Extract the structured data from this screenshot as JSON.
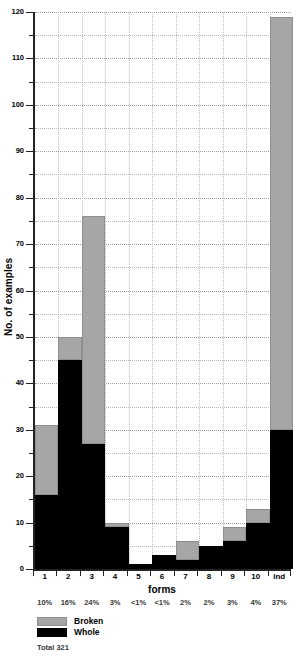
{
  "chart_data": {
    "type": "bar",
    "subtype": "stacked-bar",
    "title": "",
    "xlabel": "forms",
    "ylabel": "No. of examples",
    "categories": [
      "1",
      "2",
      "3",
      "4",
      "5",
      "6",
      "7",
      "8",
      "9",
      "10",
      "ind"
    ],
    "series": [
      {
        "name": "Whole",
        "color": "#000000",
        "values": [
          16,
          45,
          27,
          9,
          1,
          3,
          2,
          5,
          6,
          10,
          30
        ]
      },
      {
        "name": "Broken",
        "color": "#a6a6a6",
        "values": [
          15,
          5,
          49,
          1,
          0,
          0,
          4,
          0,
          3,
          3,
          89
        ]
      }
    ],
    "totals": [
      31,
      50,
      76,
      10,
      1,
      3,
      6,
      5,
      9,
      13,
      119
    ],
    "percent_labels": [
      "10%",
      "16%",
      "24%",
      "3%",
      "<1%",
      "<1%",
      "2%",
      "2%",
      "3%",
      "4%",
      "37%"
    ],
    "ylim": [
      0,
      120
    ],
    "ytick_major": [
      0,
      10,
      20,
      30,
      40,
      50,
      60,
      70,
      80,
      90,
      100,
      110,
      120
    ],
    "ytick_minor": [
      5,
      15,
      25,
      35,
      45,
      55,
      65,
      75,
      85,
      95,
      105,
      115
    ],
    "ytick_labels": [
      "0",
      "10",
      "20",
      "30",
      "40",
      "50",
      "60",
      "70",
      "80",
      "90",
      "100",
      "110",
      "120"
    ],
    "grid": true,
    "legend_position": "below-left",
    "legend": [
      {
        "label": "Broken",
        "color": "#a6a6a6"
      },
      {
        "label": "Whole",
        "color": "#000000"
      }
    ],
    "annotation_total": "Total 321"
  }
}
